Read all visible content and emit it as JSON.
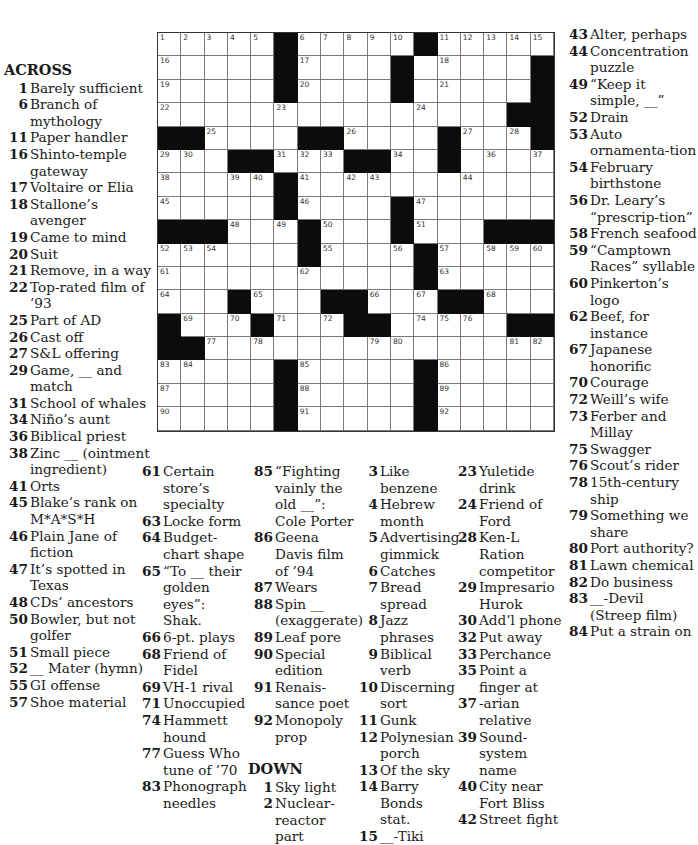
{
  "grid": {
    "rows": 17,
    "cols": 17,
    "layout": [
      "11111011111011111",
      "11111011110111110",
      "11111011110111110",
      "11111111111111100",
      "00111100111101110",
      "11100111001101111",
      "11111011111111111",
      "11111011110111111",
      "00011101110111000",
      "11111101111011111",
      "11111111111011111",
      "11101110011100111",
      "01110111001111100",
      "00111111111111111",
      "11111011111011111",
      "11111011111011111",
      "11111011111011111"
    ],
    "numbers": [
      [
        1,
        2,
        3,
        4,
        5,
        null,
        6,
        7,
        8,
        9,
        10,
        null,
        11,
        12,
        13,
        14,
        15
      ],
      [
        16,
        null,
        null,
        null,
        null,
        null,
        17,
        null,
        null,
        null,
        null,
        null,
        18,
        null,
        null,
        null,
        null
      ],
      [
        19,
        null,
        null,
        null,
        null,
        null,
        20,
        null,
        null,
        null,
        null,
        null,
        21,
        null,
        null,
        null,
        null
      ],
      [
        22,
        null,
        null,
        null,
        null,
        23,
        null,
        null,
        null,
        null,
        null,
        24,
        null,
        null,
        null,
        null,
        null
      ],
      [
        null,
        null,
        25,
        null,
        null,
        null,
        null,
        null,
        26,
        null,
        null,
        null,
        null,
        27,
        null,
        28,
        null
      ],
      [
        29,
        30,
        null,
        null,
        null,
        31,
        32,
        33,
        null,
        null,
        34,
        null,
        35,
        null,
        36,
        null,
        37
      ],
      [
        38,
        null,
        null,
        39,
        40,
        null,
        41,
        null,
        42,
        43,
        null,
        null,
        null,
        44,
        null,
        null,
        null
      ],
      [
        45,
        null,
        null,
        null,
        null,
        null,
        46,
        null,
        null,
        null,
        null,
        47,
        null,
        null,
        null,
        null,
        null
      ],
      [
        null,
        null,
        null,
        48,
        null,
        49,
        null,
        50,
        null,
        null,
        null,
        51,
        null,
        null,
        null,
        null,
        null
      ],
      [
        52,
        53,
        54,
        null,
        null,
        null,
        null,
        55,
        null,
        null,
        56,
        null,
        57,
        null,
        58,
        59,
        60
      ],
      [
        61,
        null,
        null,
        null,
        null,
        null,
        62,
        null,
        null,
        null,
        null,
        null,
        63,
        null,
        null,
        null,
        null
      ],
      [
        64,
        null,
        null,
        null,
        65,
        null,
        null,
        null,
        null,
        66,
        null,
        67,
        null,
        null,
        68,
        null,
        null
      ],
      [
        null,
        69,
        null,
        70,
        null,
        71,
        null,
        72,
        73,
        null,
        null,
        74,
        75,
        76,
        null,
        null,
        null
      ],
      [
        null,
        null,
        77,
        null,
        78,
        null,
        null,
        null,
        null,
        79,
        80,
        null,
        null,
        null,
        null,
        81,
        82
      ],
      [
        83,
        84,
        null,
        null,
        null,
        null,
        85,
        null,
        null,
        null,
        null,
        null,
        86,
        null,
        null,
        null,
        null
      ],
      [
        87,
        null,
        null,
        null,
        null,
        null,
        88,
        null,
        null,
        null,
        null,
        null,
        89,
        null,
        null,
        null,
        null
      ],
      [
        90,
        null,
        null,
        null,
        null,
        null,
        91,
        null,
        null,
        null,
        null,
        null,
        92,
        null,
        null,
        null,
        null
      ]
    ]
  },
  "across_header": "ACROSS",
  "down_header": "DOWN",
  "colA": [
    {
      "num": "1",
      "text": "Barely sufficient"
    },
    {
      "num": "6",
      "text": "Branch of mythology"
    },
    {
      "num": "11",
      "text": "Paper handler"
    },
    {
      "num": "16",
      "text": "Shinto-temple gateway"
    },
    {
      "num": "17",
      "text": "Voltaire or Elia"
    },
    {
      "num": "18",
      "text": "Stallone’s avenger"
    },
    {
      "num": "19",
      "text": "Came to mind"
    },
    {
      "num": "20",
      "text": "Suit"
    },
    {
      "num": "21",
      "text": "Remove, in a way"
    },
    {
      "num": "22",
      "text": "Top-rated film of ’93"
    },
    {
      "num": "25",
      "text": "Part of AD"
    },
    {
      "num": "26",
      "text": "Cast off"
    },
    {
      "num": "27",
      "text": "S&L offering"
    },
    {
      "num": "29",
      "text": "Game, __ and match"
    },
    {
      "num": "31",
      "text": "School of whales"
    },
    {
      "num": "34",
      "text": "Niño’s aunt"
    },
    {
      "num": "36",
      "text": "Biblical priest"
    },
    {
      "num": "38",
      "text": "Zinc __ (ointment ingredient)"
    },
    {
      "num": "41",
      "text": "Orts"
    },
    {
      "num": "45",
      "text": "Blake’s rank on M*A*S*H"
    },
    {
      "num": "46",
      "text": "Plain Jane of fiction"
    },
    {
      "num": "47",
      "text": "It’s spotted in Texas"
    },
    {
      "num": "48",
      "text": "CDs’ ancestors"
    },
    {
      "num": "50",
      "text": "Bowler, but not golfer"
    },
    {
      "num": "51",
      "text": "Small piece"
    },
    {
      "num": "52",
      "text": "__ Mater (hymn)"
    },
    {
      "num": "55",
      "text": "GI offense"
    },
    {
      "num": "57",
      "text": "Shoe material"
    }
  ],
  "colB": [
    {
      "num": "61",
      "text": "Certain store’s specialty"
    },
    {
      "num": "63",
      "text": "Locke form"
    },
    {
      "num": "64",
      "text": "Budget-chart shape"
    },
    {
      "num": "65",
      "text": "“To __ their golden eyes”: Shak."
    },
    {
      "num": "66",
      "text": "6-pt. plays"
    },
    {
      "num": "68",
      "text": "Friend of Fidel"
    },
    {
      "num": "69",
      "text": "VH-1 rival"
    },
    {
      "num": "71",
      "text": "Unoccupied"
    },
    {
      "num": "74",
      "text": "Hammett hound"
    },
    {
      "num": "77",
      "text": "Guess Who tune of ’70"
    },
    {
      "num": "83",
      "text": "Phonograph needles"
    }
  ],
  "colC": [
    {
      "num": "85",
      "text": "“Fighting vainly the old __”: Cole Porter"
    },
    {
      "num": "86",
      "text": "Geena Davis film of ’94"
    },
    {
      "num": "87",
      "text": "Wears"
    },
    {
      "num": "88",
      "text": "Spin __ (exaggerate)"
    },
    {
      "num": "89",
      "text": "Leaf pore"
    },
    {
      "num": "90",
      "text": "Special edition"
    },
    {
      "num": "91",
      "text": "Renais-sance poet"
    },
    {
      "num": "92",
      "text": "Monopoly prop"
    }
  ],
  "colC_down": [
    {
      "num": "1",
      "text": "Sky light"
    },
    {
      "num": "2",
      "text": "Nuclear-reactor part"
    }
  ],
  "colD": [
    {
      "num": "3",
      "text": "Like benzene"
    },
    {
      "num": "4",
      "text": "Hebrew month"
    },
    {
      "num": "5",
      "text": "Advertising gimmick"
    },
    {
      "num": "6",
      "text": "Catches"
    },
    {
      "num": "7",
      "text": "Bread spread"
    },
    {
      "num": "8",
      "text": "Jazz phrases"
    },
    {
      "num": "9",
      "text": "Biblical verb"
    },
    {
      "num": "10",
      "text": "Discerning sort"
    },
    {
      "num": "11",
      "text": "Gunk"
    },
    {
      "num": "12",
      "text": "Polynesian porch"
    },
    {
      "num": "13",
      "text": "Of the sky"
    },
    {
      "num": "14",
      "text": "Barry Bonds stat."
    },
    {
      "num": "15",
      "text": "__-Tiki"
    }
  ],
  "colE": [
    {
      "num": "23",
      "text": "Yuletide drink"
    },
    {
      "num": "24",
      "text": "Friend of Ford"
    },
    {
      "num": "28",
      "text": "Ken-L Ration competitor"
    },
    {
      "num": "29",
      "text": "Impresario Hurok"
    },
    {
      "num": "30",
      "text": "Add’l phone"
    },
    {
      "num": "32",
      "text": "Put away"
    },
    {
      "num": "33",
      "text": "Perchance"
    },
    {
      "num": "35",
      "text": "Point a finger at"
    },
    {
      "num": "37",
      "text": "-arian relative"
    },
    {
      "num": "39",
      "text": "Sound-system name"
    },
    {
      "num": "40",
      "text": "City near Fort Bliss"
    },
    {
      "num": "42",
      "text": "Street fight"
    }
  ],
  "colF": [
    {
      "num": "43",
      "text": "Alter, perhaps"
    },
    {
      "num": "44",
      "text": "Concentration puzzle"
    },
    {
      "num": "49",
      "text": "“Keep it simple, __”"
    },
    {
      "num": "52",
      "text": "Drain"
    },
    {
      "num": "53",
      "text": "Auto ornamenta-tion"
    },
    {
      "num": "54",
      "text": "February birthstone"
    },
    {
      "num": "56",
      "text": "Dr. Leary’s “prescrip-tion”"
    },
    {
      "num": "58",
      "text": "French seafood"
    },
    {
      "num": "59",
      "text": "“Camptown Races” syllable"
    },
    {
      "num": "60",
      "text": "Pinkerton’s logo"
    },
    {
      "num": "62",
      "text": "Beef, for instance"
    },
    {
      "num": "67",
      "text": "Japanese honorific"
    },
    {
      "num": "70",
      "text": "Courage"
    },
    {
      "num": "72",
      "text": "Weill’s wife"
    },
    {
      "num": "73",
      "text": "Ferber and Millay"
    },
    {
      "num": "75",
      "text": "Swagger"
    },
    {
      "num": "76",
      "text": "Scout’s rider"
    },
    {
      "num": "78",
      "text": "15th-century ship"
    },
    {
      "num": "79",
      "text": "Something we share"
    },
    {
      "num": "80",
      "text": "Port authority?"
    },
    {
      "num": "81",
      "text": "Lawn chemical"
    },
    {
      "num": "82",
      "text": "Do business"
    },
    {
      "num": "83",
      "text": "__-Devil (Streep film)"
    },
    {
      "num": "84",
      "text": "Put a strain on"
    }
  ]
}
